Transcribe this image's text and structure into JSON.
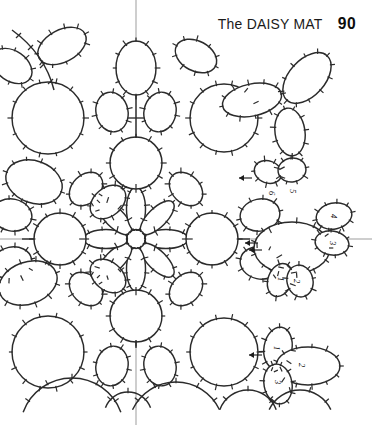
{
  "page": {
    "background_color": "#ffffff",
    "ink_color": "#2b2b2b",
    "axis_color": "#8d8d8d",
    "width": 372,
    "height": 425
  },
  "header": {
    "title": "The DAISY MAT",
    "page_number": "90"
  },
  "diagram": {
    "name": "daisy-mat-tatting-pattern",
    "center_flower": {
      "petal_count": 8,
      "center_ring_label": ""
    },
    "step_labels": [
      {
        "id": "step-1",
        "text": "1",
        "x": 281,
        "y": 279,
        "rotation": 90
      },
      {
        "id": "step-2",
        "text": "2",
        "x": 297,
        "y": 281,
        "rotation": 90
      },
      {
        "id": "step-3",
        "text": "3",
        "x": 333,
        "y": 243,
        "rotation": 90
      },
      {
        "id": "step-4",
        "text": "4",
        "x": 334,
        "y": 216,
        "rotation": 90
      },
      {
        "id": "step-5",
        "text": "5",
        "x": 293,
        "y": 191,
        "rotation": 90
      },
      {
        "id": "step-6",
        "text": "6",
        "x": 272,
        "y": 193,
        "rotation": 90
      },
      {
        "id": "step-1b",
        "text": "1",
        "x": 277,
        "y": 348,
        "rotation": 90
      },
      {
        "id": "step-2b",
        "text": "2",
        "x": 302,
        "y": 365,
        "rotation": 90
      },
      {
        "id": "step-3b",
        "text": "3",
        "x": 278,
        "y": 382,
        "rotation": 90
      }
    ],
    "direction_arrows": [
      {
        "id": "arrow-center-right",
        "x": 258,
        "y": 243,
        "direction": "left"
      },
      {
        "id": "arrow-center-right-2",
        "x": 262,
        "y": 250,
        "direction": "left"
      },
      {
        "id": "arrow-lower-right",
        "x": 262,
        "y": 355,
        "direction": "left"
      },
      {
        "id": "arrow-upper-right",
        "x": 252,
        "y": 178,
        "direction": "left"
      }
    ],
    "guides": {
      "horizontal_axis_y": 239,
      "vertical_axis_x": 136
    }
  }
}
